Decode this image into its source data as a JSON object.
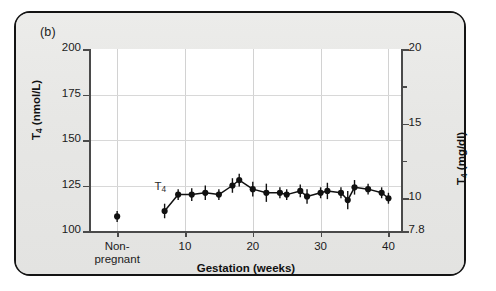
{
  "panel": {
    "label": "(b)"
  },
  "chart_data": {
    "type": "line",
    "title": "",
    "subtitle": "",
    "xlabel": "Gestation (weeks)",
    "ylabel": "T4 (nmol/L)",
    "ylabel_secondary": "T4 (mg/dl)",
    "series_annotation": "T4",
    "grid": true,
    "legend_position": "none",
    "xlim": [
      -4,
      42
    ],
    "ylim": [
      100,
      200
    ],
    "ylim_secondary": [
      7.8,
      20
    ],
    "xticks": [
      10,
      20,
      30,
      40
    ],
    "xticklabels": [
      "10",
      "20",
      "30",
      "40"
    ],
    "x_category_tick": 0,
    "x_category_label_line1": "Non-",
    "x_category_label_line2": "pregnant",
    "yticks": [
      100,
      125,
      150,
      175,
      200
    ],
    "yticklabels": [
      "100",
      "125",
      "150",
      "175",
      "200"
    ],
    "yticks_secondary": [
      7.8,
      10,
      15,
      20
    ],
    "yticklabels_secondary": [
      "7.8",
      "10",
      "15",
      "20"
    ],
    "yticks_secondary_minor": [
      12.5,
      17.5
    ],
    "series": [
      {
        "name": "T4",
        "marker": "filled-circle",
        "error_bars": true,
        "color": "#111111",
        "points": [
          {
            "x": 0,
            "y": 108,
            "err": 3,
            "connected": false,
            "label": "Non-pregnant"
          },
          {
            "x": 7,
            "y": 111,
            "err": 4
          },
          {
            "x": 9,
            "y": 120,
            "err": 3
          },
          {
            "x": 11,
            "y": 120,
            "err": 3.5
          },
          {
            "x": 13,
            "y": 121,
            "err": 4
          },
          {
            "x": 15,
            "y": 120,
            "err": 3
          },
          {
            "x": 17,
            "y": 125,
            "err": 4
          },
          {
            "x": 18,
            "y": 128,
            "err": 3.5
          },
          {
            "x": 20,
            "y": 123,
            "err": 4
          },
          {
            "x": 22,
            "y": 121,
            "err": 5
          },
          {
            "x": 24,
            "y": 121,
            "err": 3
          },
          {
            "x": 25,
            "y": 120,
            "err": 3
          },
          {
            "x": 27,
            "y": 122,
            "err": 3.5
          },
          {
            "x": 28,
            "y": 119,
            "err": 4
          },
          {
            "x": 30,
            "y": 121,
            "err": 3
          },
          {
            "x": 31,
            "y": 122,
            "err": 4.5
          },
          {
            "x": 33,
            "y": 121,
            "err": 3
          },
          {
            "x": 34,
            "y": 117,
            "err": 5
          },
          {
            "x": 35,
            "y": 124,
            "err": 4
          },
          {
            "x": 37,
            "y": 123,
            "err": 3
          },
          {
            "x": 39,
            "y": 121,
            "err": 3
          },
          {
            "x": 40,
            "y": 118,
            "err": 3
          }
        ]
      }
    ]
  }
}
